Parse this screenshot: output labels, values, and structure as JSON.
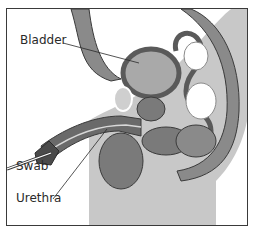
{
  "diagram": {
    "type": "anatomical cross-section",
    "labels": [
      {
        "id": "bladder",
        "text": "Bladder"
      },
      {
        "id": "swab",
        "text": "Swab"
      },
      {
        "id": "urethra",
        "text": "Urethra"
      }
    ],
    "colors": {
      "body_light": "#c8c8c8",
      "tissue_mid": "#8a8a8a",
      "tissue_dark": "#6a6a6a",
      "organ_fill": "#a9a9a9",
      "outline": "#3a3a3a",
      "frame": "#3a3a3a"
    }
  }
}
